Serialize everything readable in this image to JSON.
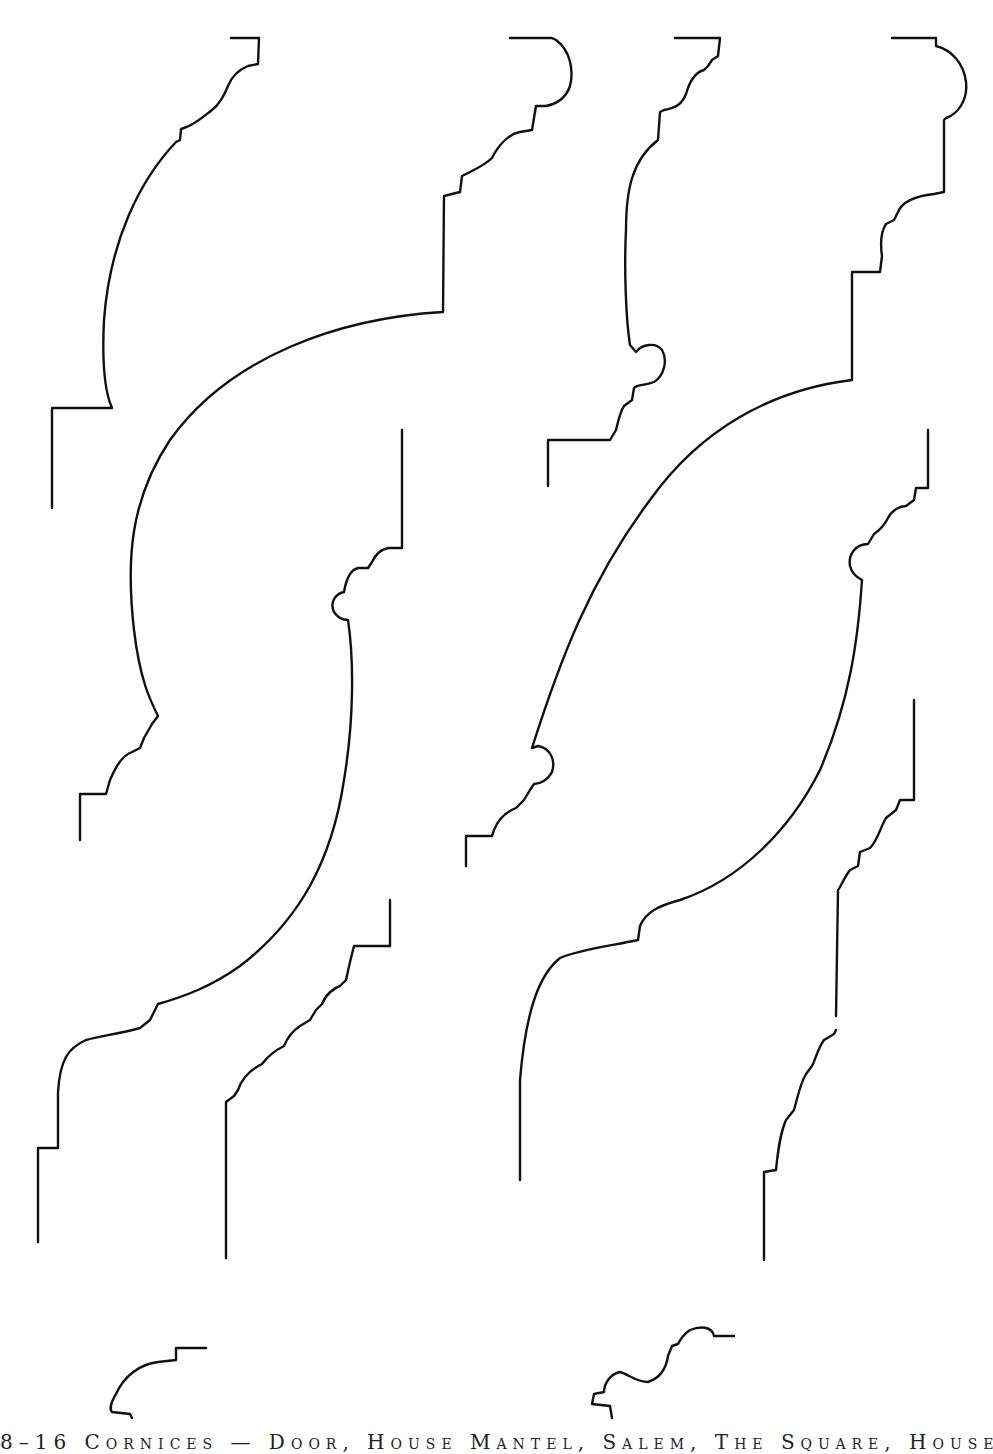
{
  "plate": {
    "caption": "8–16  Cornices — Door, House Mantel, Salem, The Square, House",
    "profiles": [
      {
        "id": "profile-1",
        "label": "cornice profile"
      },
      {
        "id": "profile-2",
        "label": "cornice profile"
      },
      {
        "id": "profile-3",
        "label": "cornice profile"
      },
      {
        "id": "profile-4",
        "label": "cornice profile"
      },
      {
        "id": "profile-5",
        "label": "cornice profile"
      },
      {
        "id": "profile-6",
        "label": "cornice profile"
      },
      {
        "id": "profile-7",
        "label": "cornice profile"
      },
      {
        "id": "profile-8",
        "label": "small moulding profile"
      },
      {
        "id": "profile-9",
        "label": "small moulding profile"
      }
    ],
    "line_color": "#111111",
    "background": "#ffffff"
  }
}
